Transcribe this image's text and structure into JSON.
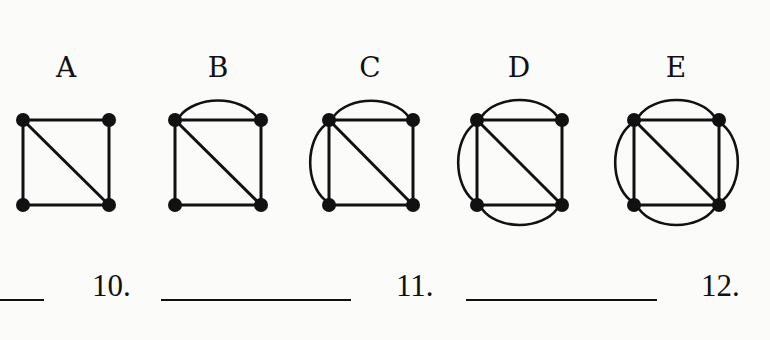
{
  "graphs": [
    {
      "label": "A",
      "arcs": []
    },
    {
      "label": "B",
      "arcs": [
        "top"
      ]
    },
    {
      "label": "C",
      "arcs": [
        "top",
        "left"
      ]
    },
    {
      "label": "D",
      "arcs": [
        "top",
        "left",
        "bottom"
      ]
    },
    {
      "label": "E",
      "arcs": [
        "top",
        "left",
        "right",
        "bottom"
      ]
    }
  ],
  "questions": [
    {
      "number": "10."
    },
    {
      "number": "11."
    },
    {
      "number": "12."
    }
  ],
  "colors": {
    "ink": "#111111",
    "paper": "#fbfbfa"
  }
}
